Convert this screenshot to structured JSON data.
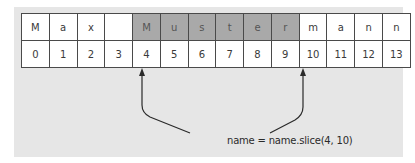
{
  "figure": {
    "characters": [
      "M",
      "a",
      "x",
      "",
      "M",
      "u",
      "s",
      "t",
      "e",
      "r",
      "m",
      "a",
      "n",
      "n"
    ],
    "indices": [
      "0",
      "1",
      "2",
      "3",
      "4",
      "5",
      "6",
      "7",
      "8",
      "9",
      "10",
      "11",
      "12",
      "13"
    ],
    "highlighted_range": [
      4,
      10
    ],
    "caption": "name = name.slice(4, 10)",
    "colors": {
      "panel": "#e6e6e6",
      "highlight": "#a9a9a9",
      "cell": "#ffffff",
      "border": "#4a4a4a"
    }
  }
}
